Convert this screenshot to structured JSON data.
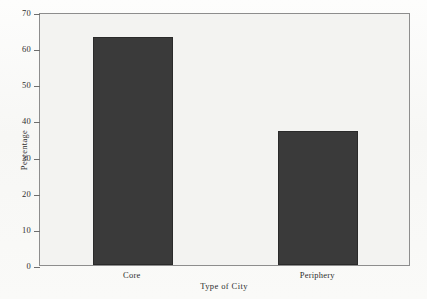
{
  "chart_data": {
    "type": "bar",
    "title": "",
    "subtitle": "",
    "categories": [
      "Core",
      "Periphery"
    ],
    "values": [
      63,
      37
    ],
    "series": [
      {
        "name": "Percentage",
        "values": [
          63,
          37
        ]
      }
    ],
    "xlabel": "Type of City",
    "ylabel": "Percentage",
    "ylim": [
      0,
      70
    ],
    "yticks": [
      0,
      10,
      20,
      30,
      40,
      50,
      60,
      70
    ],
    "ytick_labels": [
      "0",
      "10",
      "20",
      "30",
      "40",
      "50",
      "60",
      "70"
    ],
    "xtick_labels": [
      "Core",
      "Periphery"
    ],
    "grid": false,
    "legend": false,
    "legend_position": "none",
    "bar_color": "#3a3a3a",
    "bar_edge_color": "#2a2a2a",
    "frame_color": "#8d8d8d",
    "plot_background": "#f3f3f1",
    "figure_background": "#fbfbfa",
    "text_color": "#2e2e2e"
  }
}
